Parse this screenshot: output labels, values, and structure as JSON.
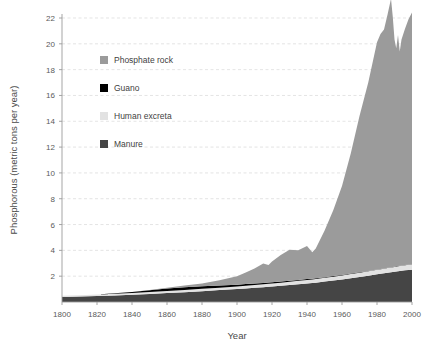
{
  "chart_data": {
    "type": "area",
    "stacked": true,
    "title": "",
    "xlabel": "Year",
    "ylabel": "Phosphorous (metric tons per year)",
    "xlim": [
      1800,
      2000
    ],
    "ylim": [
      0,
      22
    ],
    "grid": true,
    "legend_position": "upper-left-inside",
    "xticks": [
      1800,
      1820,
      1840,
      1860,
      1880,
      1900,
      1920,
      1940,
      1960,
      1980,
      2000
    ],
    "yticks": [
      2,
      4,
      6,
      8,
      10,
      12,
      14,
      16,
      18,
      20,
      22
    ],
    "x": [
      1800,
      1810,
      1820,
      1830,
      1840,
      1850,
      1860,
      1870,
      1880,
      1890,
      1900,
      1905,
      1910,
      1915,
      1918,
      1920,
      1925,
      1930,
      1935,
      1940,
      1943,
      1945,
      1950,
      1955,
      1960,
      1965,
      1970,
      1975,
      1980,
      1982,
      1984,
      1986,
      1988,
      1989,
      1990,
      1991,
      1992,
      1993,
      1994,
      1996,
      1998,
      2000
    ],
    "series": [
      {
        "name": "Manure",
        "color": "#454545",
        "values": [
          0.38,
          0.42,
          0.46,
          0.51,
          0.56,
          0.62,
          0.69,
          0.76,
          0.84,
          0.92,
          1.0,
          1.05,
          1.1,
          1.15,
          1.18,
          1.2,
          1.26,
          1.32,
          1.38,
          1.44,
          1.48,
          1.5,
          1.58,
          1.66,
          1.74,
          1.84,
          1.94,
          2.04,
          2.14,
          2.18,
          2.22,
          2.26,
          2.3,
          2.32,
          2.34,
          2.36,
          2.38,
          2.4,
          2.42,
          2.45,
          2.48,
          2.5
        ]
      },
      {
        "name": "Human excreta",
        "color": "#e2e2e2",
        "values": [
          0.1,
          0.11,
          0.12,
          0.13,
          0.14,
          0.15,
          0.16,
          0.17,
          0.18,
          0.19,
          0.2,
          0.21,
          0.22,
          0.22,
          0.23,
          0.23,
          0.24,
          0.25,
          0.26,
          0.27,
          0.27,
          0.28,
          0.29,
          0.3,
          0.31,
          0.32,
          0.33,
          0.34,
          0.35,
          0.36,
          0.36,
          0.37,
          0.37,
          0.38,
          0.38,
          0.38,
          0.39,
          0.39,
          0.39,
          0.4,
          0.4,
          0.41
        ]
      },
      {
        "name": "Guano",
        "color": "#000000",
        "values": [
          0.0,
          0.0,
          0.01,
          0.03,
          0.08,
          0.14,
          0.2,
          0.22,
          0.2,
          0.17,
          0.14,
          0.13,
          0.12,
          0.11,
          0.1,
          0.1,
          0.09,
          0.08,
          0.07,
          0.07,
          0.06,
          0.06,
          0.05,
          0.05,
          0.04,
          0.04,
          0.03,
          0.03,
          0.03,
          0.02,
          0.02,
          0.02,
          0.02,
          0.02,
          0.02,
          0.02,
          0.02,
          0.02,
          0.02,
          0.02,
          0.02,
          0.02
        ]
      },
      {
        "name": "Phosphate rock",
        "color": "#9b9b9b",
        "values": [
          0.0,
          0.0,
          0.0,
          0.0,
          0.0,
          0.02,
          0.06,
          0.12,
          0.22,
          0.4,
          0.66,
          0.9,
          1.15,
          1.5,
          1.35,
          1.6,
          2.05,
          2.4,
          2.3,
          2.55,
          2.05,
          2.3,
          3.6,
          5.1,
          6.9,
          9.3,
          12.1,
          14.6,
          17.6,
          18.2,
          18.5,
          19.6,
          20.8,
          19.4,
          17.6,
          16.9,
          17.9,
          16.6,
          17.5,
          18.3,
          19.0,
          19.5
        ]
      }
    ],
    "legend_entries": [
      {
        "label": "Phosphate rock",
        "color": "#9b9b9b"
      },
      {
        "label": "Guano",
        "color": "#000000"
      },
      {
        "label": "Human excreta",
        "color": "#e2e2e2"
      },
      {
        "label": "Manure",
        "color": "#454545"
      }
    ]
  }
}
